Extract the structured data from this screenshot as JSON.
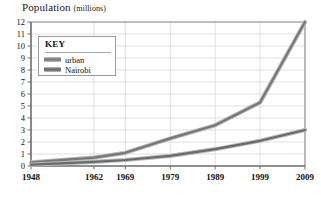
{
  "chart_data": {
    "type": "line",
    "title": "Population",
    "title_units": "(millions)",
    "xlabel": "",
    "ylabel": "Population (millions)",
    "x": [
      1948,
      1962,
      1969,
      1979,
      1989,
      1999,
      2009
    ],
    "x_positions": [
      1948,
      1962,
      1969,
      1979,
      1989,
      1999,
      2009
    ],
    "xticklabels": [
      "1948",
      "1962",
      "1969",
      "1979",
      "1989",
      "1999",
      "2009"
    ],
    "yticklabels": [
      "0",
      "1",
      "2",
      "3",
      "4",
      "5",
      "6",
      "7",
      "8",
      "9",
      "10",
      "11",
      "12"
    ],
    "ylim": [
      0,
      12
    ],
    "ytick_step": 1,
    "grid": true,
    "grid_color": "#d8d8d8",
    "legend_position": "upper-left",
    "legend_title": "KEY",
    "series": [
      {
        "name": "urban",
        "color": "#777777",
        "values": [
          0.3,
          0.7,
          1.1,
          2.3,
          3.4,
          5.3,
          12.0
        ]
      },
      {
        "name": "Nairobi",
        "color": "#6a6a6a",
        "values": [
          0.12,
          0.35,
          0.5,
          0.85,
          1.4,
          2.1,
          3.0
        ]
      }
    ]
  },
  "legend": {
    "title": "KEY",
    "entries": [
      {
        "label": "urban",
        "color": "#808080"
      },
      {
        "label": "Nairobi",
        "color": "#6e6e6e"
      }
    ]
  },
  "colors": {
    "axis": "#6f6f6f",
    "frame": "#8c8c8c",
    "grid": "#d8d8d8",
    "text": "#111111",
    "background": "#ffffff"
  }
}
